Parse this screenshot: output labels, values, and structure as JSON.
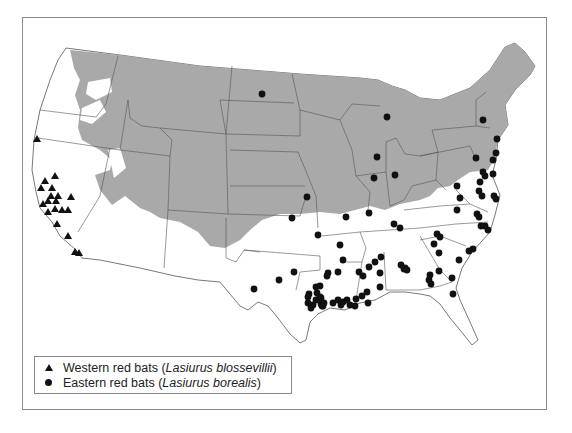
{
  "legend": {
    "items": [
      {
        "symbol": "triangle",
        "common_name": "Western red bats",
        "open": " (",
        "scientific_name": "Lasiurus blossevillii",
        "close": ")"
      },
      {
        "symbol": "circle",
        "common_name": "Eastern red bats",
        "open": " (",
        "scientific_name": "Lasiurus borealis",
        "close": ")"
      }
    ]
  },
  "colors": {
    "shaded_region": "#a9a9a9",
    "land": "#ffffff",
    "border": "#555555",
    "marker": "#111111"
  },
  "map": {
    "region": "Contiguous United States",
    "shaded_region_meaning": "northern shaded range area",
    "western_red_bat_record_count": 19,
    "eastern_red_bat_record_count": 95
  }
}
